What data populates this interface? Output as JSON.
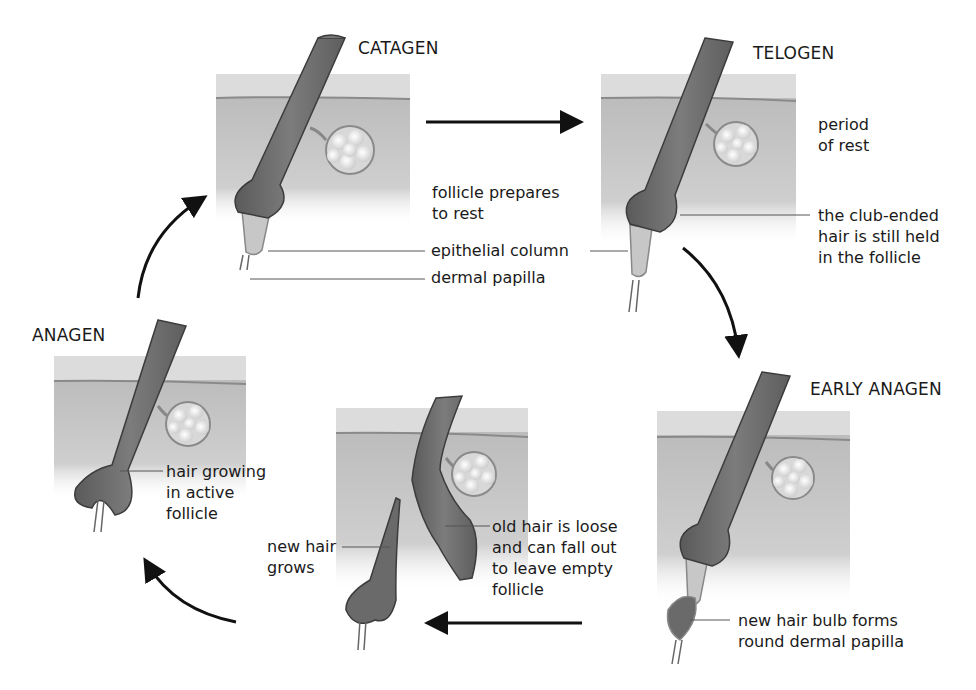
{
  "diagram": {
    "type": "cycle",
    "stages": [
      {
        "id": "catagen",
        "title": "CATAGEN",
        "labels": [
          "follicle prepares\nto rest",
          "epithelial column",
          "dermal papilla"
        ]
      },
      {
        "id": "telogen",
        "title": "TELOGEN",
        "labels": [
          "period\nof rest",
          "the club-ended\nhair is still held\nin the follicle"
        ]
      },
      {
        "id": "early-anagen",
        "title": "EARLY ANAGEN",
        "labels": [
          "new hair bulb forms\nround dermal papilla"
        ]
      },
      {
        "id": "transition",
        "title": "",
        "labels": [
          "new hair\ngrows",
          "old hair is loose\nand can fall out\nto leave empty\nfollicle"
        ]
      },
      {
        "id": "anagen",
        "title": "ANAGEN",
        "labels": [
          "hair growing\nin active\nfollicle"
        ]
      }
    ],
    "flow": [
      [
        "anagen",
        "catagen"
      ],
      [
        "catagen",
        "telogen"
      ],
      [
        "telogen",
        "early-anagen"
      ],
      [
        "early-anagen",
        "transition"
      ],
      [
        "transition",
        "anagen"
      ]
    ],
    "colors": {
      "skin_top": "#d9d9d9",
      "skin_dermis": "#bdbdbd",
      "hair": "#6e6e6e",
      "hair_outline": "#3c3c3c",
      "gland": "#e6e6e6",
      "arrow": "#111111",
      "leader_line": "#555555"
    }
  }
}
